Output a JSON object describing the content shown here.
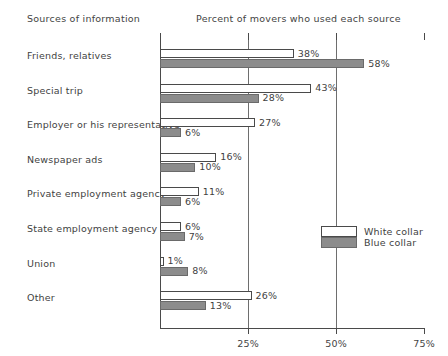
{
  "header": {
    "left_title": "Sources of information",
    "right_title": "Percent of movers who used each source"
  },
  "legend": {
    "white_label": "White collar",
    "blue_label": "Blue collar"
  },
  "axis": {
    "ticks": [
      "25%",
      "50%",
      "75%"
    ],
    "tick_values": [
      25,
      50,
      75
    ]
  },
  "chart_data": {
    "type": "bar",
    "orientation": "horizontal",
    "title": "Percent of movers who used each source",
    "xlabel": "Percent of movers who used each source",
    "ylabel": "Sources of information",
    "xlim": [
      0,
      75
    ],
    "xticks": [
      25,
      50,
      75
    ],
    "xticklabels": [
      "25%",
      "50%",
      "75%"
    ],
    "grid": "vertical gridlines at 25% and 50%",
    "legend_position": "right-middle",
    "categories": [
      "Friends, relatives",
      "Special trip",
      "Employer or his representative",
      "Newspaper ads",
      "Private employment agency",
      "State employment agency",
      "Union",
      "Other"
    ],
    "series": [
      {
        "name": "White collar",
        "color": "#ffffff",
        "values": [
          38,
          43,
          27,
          16,
          11,
          6,
          1,
          26
        ],
        "labels": [
          "38%",
          "43%",
          "27%",
          "16%",
          "11%",
          "6%",
          "1%",
          "26%"
        ]
      },
      {
        "name": "Blue collar",
        "color": "#8c8c8c",
        "values": [
          58,
          28,
          6,
          10,
          6,
          7,
          8,
          13
        ],
        "labels": [
          "58%",
          "28%",
          "6%",
          "10%",
          "6%",
          "7%",
          "8%",
          "13%"
        ]
      }
    ]
  }
}
